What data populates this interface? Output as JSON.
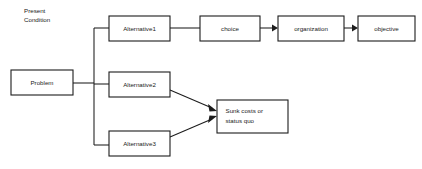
{
  "diagram": {
    "type": "flowchart",
    "title_label": "",
    "background_color": "#ffffff",
    "line_color": "#1c1c1c",
    "text_color": "#1a1a1a",
    "plain_labels": [
      {
        "id": "present-condition",
        "lines": [
          "Present",
          "Condition"
        ],
        "x": 24,
        "y": 13
      }
    ],
    "nodes": [
      {
        "id": "problem",
        "label": "Problem",
        "x": 11,
        "y": 70,
        "w": 62,
        "h": 25,
        "lines": [
          "Problem"
        ]
      },
      {
        "id": "alternative1",
        "label": "Alternative1",
        "x": 109,
        "y": 16,
        "w": 61,
        "h": 25,
        "lines": [
          "Alternative1"
        ]
      },
      {
        "id": "alternative2",
        "label": "Alternative2",
        "x": 109,
        "y": 72,
        "w": 61,
        "h": 25,
        "lines": [
          "Alternative2"
        ]
      },
      {
        "id": "alternative3",
        "label": "Alternative3",
        "x": 109,
        "y": 131,
        "w": 61,
        "h": 25,
        "lines": [
          "Alternative3"
        ]
      },
      {
        "id": "choice",
        "label": "choice",
        "x": 200,
        "y": 16,
        "w": 60,
        "h": 25,
        "lines": [
          "choice"
        ]
      },
      {
        "id": "organization",
        "label": "organization",
        "x": 278,
        "y": 16,
        "w": 66,
        "h": 25,
        "lines": [
          "organization"
        ]
      },
      {
        "id": "objective",
        "label": "objective",
        "x": 358,
        "y": 16,
        "w": 57,
        "h": 25,
        "lines": [
          "objective"
        ]
      },
      {
        "id": "sunk-costs",
        "label": "Sunk costs or status quo",
        "x": 217,
        "y": 100,
        "w": 71,
        "h": 33,
        "lines": [
          "Sunk costs or",
          "status quo"
        ]
      }
    ],
    "edges": [
      {
        "id": "problem-to-trunk",
        "from": "problem",
        "to": "trunk",
        "arrow": false,
        "points": "73,83 94,83"
      },
      {
        "id": "trunk-vertical",
        "from": "trunk",
        "to": "trunk",
        "arrow": false,
        "points": "94,28 94,145"
      },
      {
        "id": "trunk-to-alternative1",
        "from": "trunk",
        "to": "alternative1",
        "arrow": false,
        "points": "94,28 109,28"
      },
      {
        "id": "trunk-to-alternative2",
        "from": "trunk",
        "to": "alternative2",
        "arrow": false,
        "points": "94,84 109,84"
      },
      {
        "id": "trunk-to-alternative3",
        "from": "trunk",
        "to": "alternative3",
        "arrow": false,
        "points": "94,145 109,145"
      },
      {
        "id": "alternative1-to-choice",
        "from": "alternative1",
        "to": "choice",
        "arrow": false,
        "points": "170,28 200,28"
      },
      {
        "id": "choice-to-organization",
        "from": "choice",
        "to": "organization",
        "arrow": true,
        "points": "260,28 277,28"
      },
      {
        "id": "organization-to-objective",
        "from": "organization",
        "to": "objective",
        "arrow": true,
        "points": "344,28 357,28"
      },
      {
        "id": "alternative2-to-sunk-costs",
        "from": "alternative2",
        "to": "sunk-costs",
        "arrow": true,
        "points": "170,90 216,110"
      },
      {
        "id": "alternative3-to-sunk-costs",
        "from": "alternative3",
        "to": "sunk-costs",
        "arrow": true,
        "points": "170,137 216,117"
      }
    ]
  }
}
